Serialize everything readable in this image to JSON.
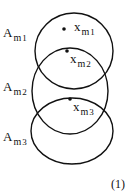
{
  "figure": {
    "equation_number": "(1)",
    "sets": [
      {
        "label": "A",
        "sub": "m",
        "subsub": "1",
        "cx": 74,
        "cy": 51,
        "rx": 39,
        "ry": 38,
        "label_x": 3,
        "label_y": 37
      },
      {
        "label": "A",
        "sub": "m",
        "subsub": "2",
        "cx": 70,
        "cy": 91,
        "rx": 38,
        "ry": 43,
        "label_x": 3,
        "label_y": 91
      },
      {
        "label": "A",
        "sub": "m",
        "subsub": "3",
        "cx": 72,
        "cy": 131,
        "rx": 41,
        "ry": 33,
        "label_x": 3,
        "label_y": 141
      }
    ],
    "points": [
      {
        "label": "x",
        "sub": "m",
        "subsub": "1",
        "x": 64,
        "y": 29,
        "label_x": 74,
        "label_y": 31
      },
      {
        "label": "x",
        "sub": "m",
        "subsub": "2",
        "x": 67,
        "y": 51,
        "label_x": 70,
        "label_y": 63
      },
      {
        "label": "x",
        "sub": "m",
        "subsub": "3",
        "x": 70,
        "y": 99,
        "label_x": 73,
        "label_y": 111
      }
    ],
    "stroke_color": "#111111"
  }
}
